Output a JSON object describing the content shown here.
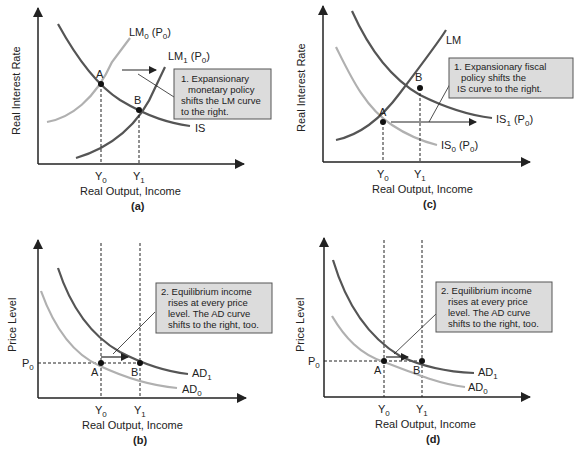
{
  "colors": {
    "axis": "#222222",
    "dark_curve": "#555555",
    "light_curve": "#b0b0b0",
    "callout_fill": "#dcdcdc",
    "callout_border": "#555555"
  },
  "panels": {
    "a": {
      "caption": "(a)",
      "y_axis_label": "Real Interest Rate",
      "x_axis_label": "Real Output, Income",
      "curves": {
        "lm0": {
          "base": "LM",
          "sub": "0",
          "suffix": " (P",
          "suffix_sub": "0",
          "close": ")"
        },
        "lm1": {
          "base": "LM",
          "sub": "1",
          "suffix": " (P",
          "suffix_sub": "0",
          "close": ")"
        },
        "is": "IS"
      },
      "points": {
        "a": "A",
        "b": "B"
      },
      "ticks": {
        "y0": {
          "base": "Y",
          "sub": "0"
        },
        "y1": {
          "base": "Y",
          "sub": "1"
        }
      },
      "callout": [
        "1. Expansionary",
        "monetary policy",
        "shifts the LM curve",
        "to the right."
      ]
    },
    "c": {
      "caption": "(c)",
      "y_axis_label": "Real Interest Rate",
      "x_axis_label": "Real Output, Income",
      "curves": {
        "lm": "LM",
        "is1": {
          "base": "IS",
          "sub": "1",
          "suffix": " (P",
          "suffix_sub": "0",
          "close": ")"
        },
        "is0": {
          "base": "IS",
          "sub": "0",
          "suffix": " (P",
          "suffix_sub": "0",
          "close": ")"
        }
      },
      "points": {
        "a": "A",
        "b": "B"
      },
      "ticks": {
        "y0": {
          "base": "Y",
          "sub": "0"
        },
        "y1": {
          "base": "Y",
          "sub": "1"
        }
      },
      "callout": [
        "1. Expansionary fiscal",
        "policy shifts the",
        "IS curve to the right."
      ]
    },
    "b": {
      "caption": "(b)",
      "y_axis_label": "Price Level",
      "x_axis_label": "Real Output, Income",
      "curves": {
        "ad1": {
          "base": "AD",
          "sub": "1"
        },
        "ad0": {
          "base": "AD",
          "sub": "0"
        }
      },
      "points": {
        "a": "A",
        "b": "B"
      },
      "price_tick": {
        "base": "P",
        "sub": "0"
      },
      "ticks": {
        "y0": {
          "base": "Y",
          "sub": "0"
        },
        "y1": {
          "base": "Y",
          "sub": "1"
        }
      },
      "callout": [
        "2. Equilibrium income",
        "rises at every price",
        "level. The AD curve",
        "shifts to the right, too."
      ]
    },
    "d": {
      "caption": "(d)",
      "y_axis_label": "Price Level",
      "x_axis_label": "Real Output, Income",
      "curves": {
        "ad1": {
          "base": "AD",
          "sub": "1"
        },
        "ad0": {
          "base": "AD",
          "sub": "0"
        }
      },
      "points": {
        "a": "A",
        "b": "B"
      },
      "price_tick": {
        "base": "P",
        "sub": "0"
      },
      "ticks": {
        "y0": {
          "base": "Y",
          "sub": "0"
        },
        "y1": {
          "base": "Y",
          "sub": "1"
        }
      },
      "callout": [
        "2. Equilibrium income",
        "rises at every price",
        "level. The AD curve",
        "shifts to the right, too."
      ]
    }
  }
}
